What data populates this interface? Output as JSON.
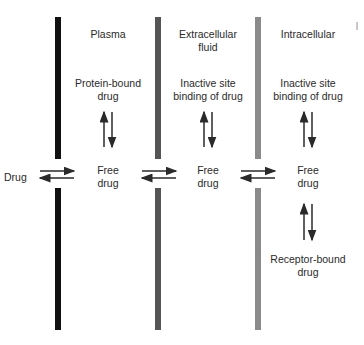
{
  "diagram": {
    "compartments": [
      {
        "name": "Plasma",
        "bound_label": "Protein-bound\ndrug",
        "free_label": "Free\ndrug"
      },
      {
        "name": "Extracellular\nfluid",
        "bound_label": "Inactive site\nbinding of drug",
        "free_label": "Free\ndrug"
      },
      {
        "name": "Intracellular",
        "bound_label": "Inactive site\nbinding of drug",
        "free_label": "Free\ndrug",
        "receptor_label": "Receptor-bound\ndrug"
      }
    ],
    "entry_label": "Drug",
    "membranes": [
      {
        "color": "#111111"
      },
      {
        "color": "#555555"
      },
      {
        "color": "#8a8a8a"
      }
    ],
    "edge_mark": "I"
  }
}
